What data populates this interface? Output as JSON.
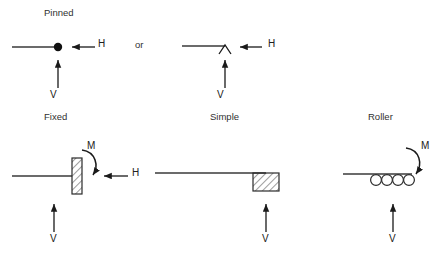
{
  "figure": {
    "background_color": "#ffffff",
    "line_color": "#1a1a1a",
    "text_color": "#2b2b2b",
    "width": 446,
    "height": 257
  },
  "labels": {
    "pinned": "Pinned",
    "or": "or",
    "fixed": "Fixed",
    "simple": "Simple",
    "roller": "Roller"
  },
  "forces": {
    "h": "H",
    "v": "V",
    "m": "M"
  },
  "supports": [
    {
      "name": "pinned-dot",
      "title": "Pinned",
      "symbol": "filled-circle-node",
      "reactions": [
        "H",
        "V"
      ]
    },
    {
      "name": "pinned-knife-edge",
      "title": "Pinned",
      "symbol": "knife-edge",
      "reactions": [
        "H",
        "V"
      ]
    },
    {
      "name": "fixed",
      "title": "Fixed",
      "symbol": "hatched-wall",
      "reactions": [
        "H",
        "V",
        "M"
      ]
    },
    {
      "name": "simple",
      "title": "Simple",
      "symbol": "hatched-block",
      "reactions": [
        "V"
      ]
    },
    {
      "name": "roller",
      "title": "Roller",
      "symbol": "roller-circles",
      "roller_count": 4,
      "reactions": [
        "V",
        "M"
      ]
    }
  ]
}
